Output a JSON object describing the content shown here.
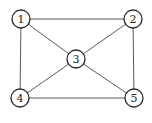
{
  "graph": {
    "type": "undirected",
    "node_radius": 9,
    "colors": {
      "edge": "#5a5a5a",
      "node_stroke": "#2a2a2a",
      "node_fill": "#ffffff",
      "label": "#222222",
      "background": "#ffffff"
    },
    "nodes": [
      {
        "id": "1",
        "label": "1",
        "x": 21,
        "y": 19
      },
      {
        "id": "2",
        "label": "2",
        "x": 133,
        "y": 19
      },
      {
        "id": "3",
        "label": "3",
        "x": 76,
        "y": 59
      },
      {
        "id": "4",
        "label": "4",
        "x": 20,
        "y": 98
      },
      {
        "id": "5",
        "label": "5",
        "x": 134,
        "y": 98
      }
    ],
    "edges": [
      {
        "from": "1",
        "to": "2"
      },
      {
        "from": "1",
        "to": "3"
      },
      {
        "from": "1",
        "to": "4"
      },
      {
        "from": "2",
        "to": "3"
      },
      {
        "from": "2",
        "to": "5"
      },
      {
        "from": "3",
        "to": "4"
      },
      {
        "from": "3",
        "to": "5"
      },
      {
        "from": "4",
        "to": "5"
      }
    ]
  }
}
